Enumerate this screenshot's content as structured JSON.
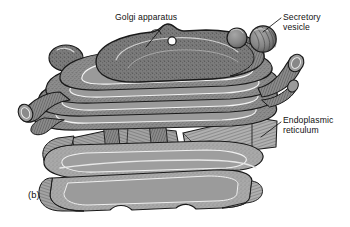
{
  "figure": {
    "panel_label": "(b)",
    "background_color": "#ffffff"
  },
  "labels": {
    "golgi": "Golgi apparatus",
    "secretory_vesicle_line1": "Secretory",
    "secretory_vesicle_line2": "vesicle",
    "endoplasmic_reticulum_line1": "Endoplasmic",
    "endoplasmic_reticulum_line2": "reticulum"
  },
  "colors": {
    "outline": "#1a1a1a",
    "golgi_fill": "#8d8d8d",
    "golgi_fill_dark": "#7b7b7b",
    "golgi_highlight": "#f2f2f2",
    "er_fill": "#a9a9a9",
    "er_fill_light": "#b8b8b8",
    "vesicle_fill": "#8a8a8a",
    "lumen_fill": "#9a9a9a",
    "pore_fill": "#ffffff",
    "text": "#111111"
  },
  "structures": {
    "golgi_cisternae_count": 5,
    "secretory_vesicles": [
      {
        "name": "small-vesicle",
        "cx": 237,
        "cy": 38,
        "r": 10
      },
      {
        "name": "large-vesicle",
        "cx": 263,
        "cy": 39,
        "r": 13
      }
    ],
    "budding_vesicle": {
      "cx": 66,
      "cy": 58,
      "rx": 16,
      "ry": 12
    },
    "golgi_pore": {
      "cx": 172,
      "cy": 41,
      "r": 4
    },
    "tubule_left": {
      "cx": 28,
      "cy": 110,
      "r": 9
    },
    "tubule_right": {
      "cx": 287,
      "cy": 72,
      "r": 10
    },
    "er_sheets_count": 4
  },
  "leaders": {
    "golgi": {
      "x1": 164,
      "y1": 25,
      "x2": 146,
      "y2": 47
    },
    "vesicle": {
      "x1": 280,
      "y1": 18,
      "x2": 262,
      "y2": 32
    },
    "er": {
      "x1": 280,
      "y1": 122,
      "x2": 262,
      "y2": 136
    }
  }
}
